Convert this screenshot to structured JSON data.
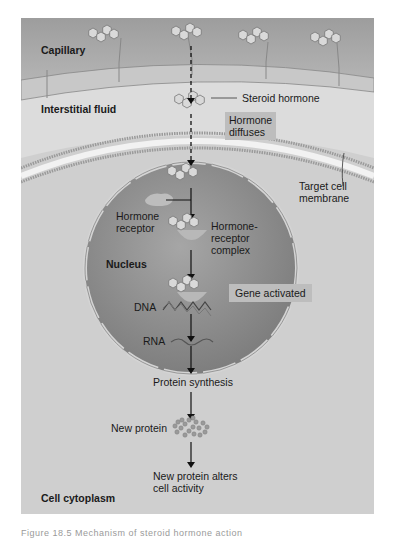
{
  "figure": {
    "regions": {
      "capillary": "Capillary",
      "interstitial": "Interstitial fluid",
      "nucleus": "Nucleus",
      "cytoplasm": "Cell cytoplasm"
    },
    "labels": {
      "steroid_hormone": "Steroid hormone",
      "hormone_diffuses_1": "Hormone",
      "hormone_diffuses_2": "diffuses",
      "target_membrane_1": "Target cell",
      "target_membrane_2": "membrane",
      "hormone_receptor_1": "Hormone",
      "hormone_receptor_2": "receptor",
      "complex_1": "Hormone-",
      "complex_2": "receptor",
      "complex_3": "complex",
      "gene_activated": "Gene activated",
      "dna": "DNA",
      "rna": "RNA",
      "protein_synthesis": "Protein synthesis",
      "new_protein": "New protein",
      "alters_1": "New protein alters",
      "alters_2": "cell activity"
    },
    "colors": {
      "capillary": "#a9a9a9",
      "interstitial": "#dcdcdc",
      "cytoplasm": "#cfcfcf",
      "nucleus": "#8f8f8f",
      "label_box": "#bdbdbd",
      "arrow": "#111111"
    }
  },
  "caption": "Figure 18.5 Mechanism of steroid hormone action"
}
